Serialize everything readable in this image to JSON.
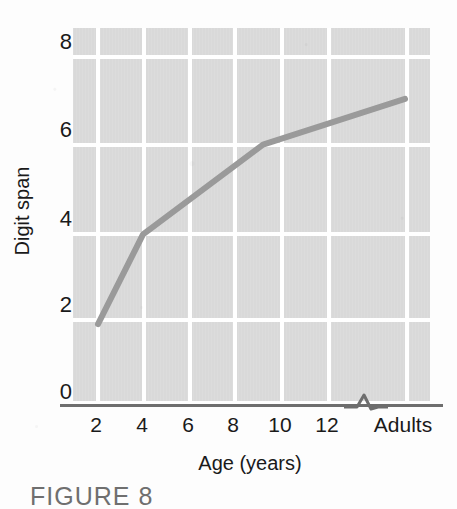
{
  "chart_data": {
    "type": "line",
    "title": "",
    "xlabel": "Age (years)",
    "ylabel": "Digit span",
    "x_tick_labels": [
      "2",
      "4",
      "6",
      "8",
      "10",
      "12",
      "Adults"
    ],
    "y_tick_labels": [
      "0",
      "2",
      "4",
      "6",
      "8"
    ],
    "ylim": [
      0,
      8.6
    ],
    "xlim_note": "2 to 13 years, then an axis break, then the Adults category",
    "axis_break": true,
    "grid": true,
    "legend": null,
    "series": [
      {
        "name": "Digit span",
        "color": "#9a9a9a",
        "points": [
          {
            "x": "2",
            "y": 1.85
          },
          {
            "x": "4",
            "y": 3.9
          },
          {
            "x": "9",
            "y": 5.95
          },
          {
            "x": "Adults",
            "y": 7.0
          }
        ]
      }
    ]
  },
  "axes": {
    "y_title": "Digit span",
    "x_title": "Age (years)",
    "y_ticks": [
      {
        "label": "8",
        "value": 8
      },
      {
        "label": "6",
        "value": 6
      },
      {
        "label": "4",
        "value": 4
      },
      {
        "label": "2",
        "value": 2
      },
      {
        "label": "0",
        "value": 0
      }
    ],
    "x_ticks": [
      {
        "label": "2",
        "value": 2
      },
      {
        "label": "4",
        "value": 4
      },
      {
        "label": "6",
        "value": 6
      },
      {
        "label": "8",
        "value": 8
      },
      {
        "label": "10",
        "value": 10
      },
      {
        "label": "12",
        "value": 12
      },
      {
        "label": "Adults",
        "value": null
      }
    ]
  },
  "caption": {
    "text": "FIGURE 8"
  },
  "colors": {
    "plot_background": "#d9d9d9",
    "gridline": "#ffffff",
    "data_line": "#9a9a9a",
    "axis_line": "#6e6e6e",
    "text": "#1a1a1a",
    "page_background": "#fdfdfd"
  }
}
